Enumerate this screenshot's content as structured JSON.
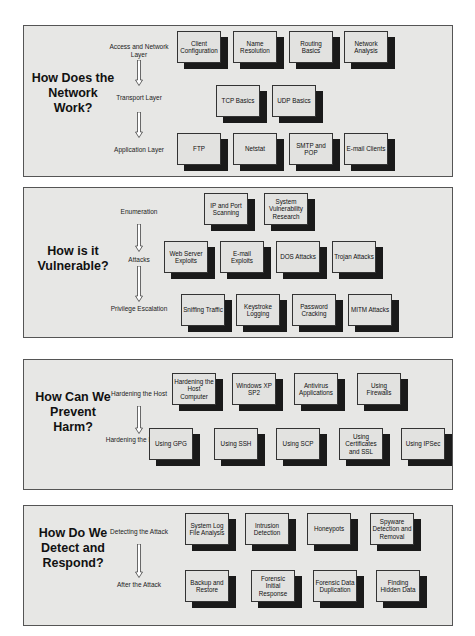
{
  "panels": [
    {
      "question": "How Does the Network Work?",
      "stages": [
        "Access and Network Layer",
        "Transport Layer",
        "Application Layer"
      ],
      "rows": [
        [
          "Client Configuration",
          "Name Resolution",
          "Routing Basics",
          "Network Analysis"
        ],
        [
          "TCP Basics",
          "UDP Basics"
        ],
        [
          "FTP",
          "Netstat",
          "SMTP and POP",
          "E-mail Clients"
        ]
      ]
    },
    {
      "question": "How is it Vulnerable?",
      "stages": [
        "Enumeration",
        "Attacks",
        "Privilege Escalation"
      ],
      "rows": [
        [
          "IP and Port Scanning",
          "System Vulnerability Research"
        ],
        [
          "Web Server Exploits",
          "E-mail Exploits",
          "DOS Attacks",
          "Trojan Attacks"
        ],
        [
          "Sniffing Traffic",
          "Keystroke Logging",
          "Password Cracking",
          "MITM Attacks"
        ]
      ]
    },
    {
      "question": "How Can We Prevent Harm?",
      "stages": [
        "Hardening the Host",
        "Hardening the Network"
      ],
      "rows": [
        [
          "Hardening the Host Computer",
          "Windows XP SP2",
          "Antivirus Applications",
          "Using Firewalls"
        ],
        [
          "Using GPG",
          "Using SSH",
          "Using SCP",
          "Using Certificates and SSL",
          "Using IPSec"
        ]
      ]
    },
    {
      "question": "How Do We Detect and Respond?",
      "stages": [
        "Detecting the Attack",
        "After the Attack"
      ],
      "rows": [
        [
          "System Log File Analysis",
          "Intrusion Detection",
          "Honeypots",
          "Spyware Detection and Removal"
        ],
        [
          "Backup and Restore",
          "Forensic Initial Response",
          "Forensic Data Duplication",
          "Finding Hidden Data"
        ]
      ]
    }
  ]
}
